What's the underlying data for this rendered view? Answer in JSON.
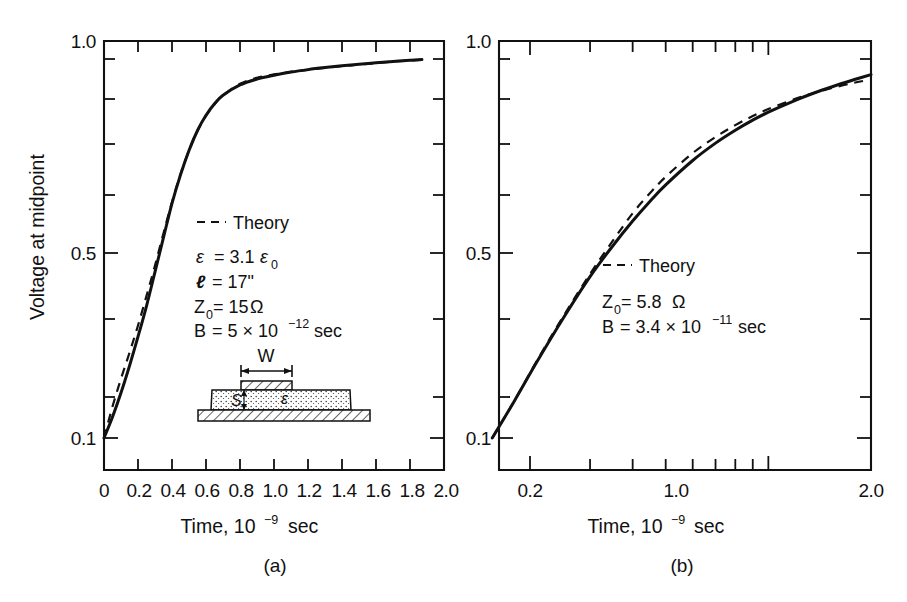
{
  "figure": {
    "caption_a": "(a)",
    "caption_b": "(b)",
    "y_axis_title": "Voltage at midpoint",
    "x_axis_title_prefix": "Time, 10",
    "x_axis_title_exp": "−9",
    "x_axis_title_suffix": "sec"
  },
  "chart_data": [
    {
      "type": "line",
      "panel": "(a)",
      "title": "",
      "xlabel": "Time, 10^-9 sec",
      "ylabel": "Voltage at midpoint",
      "xscale": "linear",
      "yscale": "log",
      "xlim": [
        0,
        2.0
      ],
      "ylim": [
        0.1,
        1.0
      ],
      "grid": false,
      "xticks": [
        0,
        0.2,
        0.4,
        0.6,
        0.8,
        1.0,
        1.2,
        1.4,
        1.6,
        1.8,
        2.0
      ],
      "xticklabels": [
        "0",
        "0.2",
        "0.4",
        "0.6",
        "0.8",
        "1.0",
        "1.2",
        "1.4",
        "1.6",
        "1.8",
        "2.0"
      ],
      "yticks": [
        0.1,
        0.2,
        0.3,
        0.4,
        0.5,
        0.6,
        0.7,
        0.8,
        0.9,
        1.0
      ],
      "yticklabels": [
        "0.1",
        "",
        "",
        "",
        "0.5",
        "",
        "",
        "",
        "",
        "1.0"
      ],
      "legend_position": "center",
      "series": [
        {
          "name": "Measured",
          "style": "solid",
          "x": [
            0.0,
            0.05,
            0.1,
            0.15,
            0.2,
            0.25,
            0.3,
            0.35,
            0.4,
            0.45,
            0.5,
            0.55,
            0.6,
            0.65,
            0.7,
            0.8,
            0.9,
            1.0,
            1.1,
            1.2,
            1.3,
            1.4,
            1.5,
            1.6,
            1.7,
            1.8,
            1.87
          ],
          "y": [
            0.1,
            0.113,
            0.13,
            0.152,
            0.18,
            0.215,
            0.262,
            0.32,
            0.39,
            0.46,
            0.53,
            0.595,
            0.65,
            0.695,
            0.73,
            0.775,
            0.802,
            0.82,
            0.835,
            0.847,
            0.857,
            0.866,
            0.874,
            0.881,
            0.888,
            0.894,
            0.898
          ]
        },
        {
          "name": "Theory",
          "style": "dashed",
          "x": [
            0.0,
            0.05,
            0.1,
            0.15,
            0.2,
            0.25,
            0.3,
            0.35,
            0.4,
            0.45,
            0.5,
            0.55,
            0.6,
            0.65,
            0.7,
            0.8,
            0.9,
            1.0,
            1.1,
            1.2,
            1.3,
            1.4,
            1.5,
            1.6,
            1.7,
            1.8,
            1.87
          ],
          "y": [
            0.1,
            0.12,
            0.141,
            0.164,
            0.192,
            0.228,
            0.272,
            0.328,
            0.393,
            0.462,
            0.53,
            0.594,
            0.648,
            0.693,
            0.729,
            0.78,
            0.808,
            0.824,
            0.836,
            0.846,
            0.855,
            0.864,
            0.872,
            0.88,
            0.887,
            0.893,
            0.897
          ]
        }
      ],
      "annotations": {
        "legend_label": "Theory",
        "lines": [
          {
            "sym": "ε",
            "eq": "= 3.1",
            "unit": "ε",
            "unit_sub": "0"
          },
          {
            "sym": "ℓ",
            "eq": "= 17\""
          },
          {
            "sym": "Z",
            "sym_sub": "0",
            "eq": "= 15",
            "unit": "Ω"
          },
          {
            "sym": "B",
            "eq": "= 5 × 10",
            "exp": "−12",
            "unit": "sec"
          }
        ]
      },
      "inset": {
        "width_label": "W",
        "substrate_label": "S",
        "permittivity_label": "ε"
      }
    },
    {
      "type": "line",
      "panel": "(b)",
      "title": "",
      "xlabel": "Time, 10^-9 sec",
      "ylabel": "Voltage at midpoint",
      "xscale": "log",
      "yscale": "log",
      "xlim": [
        0.15,
        2.0
      ],
      "ylim": [
        0.1,
        1.0
      ],
      "grid": false,
      "xticks": [
        0.2,
        0.3,
        0.4,
        0.5,
        0.6,
        0.7,
        0.8,
        0.9,
        1.0,
        2.0
      ],
      "xticklabels": [
        "0.2",
        "",
        "",
        "",
        "",
        "",
        "",
        "",
        "1.0",
        "2.0"
      ],
      "yticks": [
        0.1,
        0.2,
        0.3,
        0.4,
        0.5,
        0.6,
        0.7,
        0.8,
        0.9,
        1.0
      ],
      "yticklabels": [
        "0.1",
        "",
        "",
        "",
        "0.5",
        "",
        "",
        "",
        "",
        "1.0"
      ],
      "legend_position": "center",
      "series": [
        {
          "name": "Measured",
          "style": "solid",
          "x": [
            0.155,
            0.18,
            0.21,
            0.25,
            0.3,
            0.35,
            0.4,
            0.45,
            0.5,
            0.6,
            0.7,
            0.8,
            0.9,
            1.0,
            1.2,
            1.4,
            1.6,
            1.8,
            2.0
          ],
          "y": [
            0.1,
            0.124,
            0.156,
            0.2,
            0.255,
            0.305,
            0.352,
            0.395,
            0.434,
            0.5,
            0.553,
            0.596,
            0.632,
            0.662,
            0.709,
            0.746,
            0.776,
            0.801,
            0.823
          ]
        },
        {
          "name": "Theory",
          "style": "dashed",
          "x": [
            0.155,
            0.18,
            0.21,
            0.25,
            0.3,
            0.35,
            0.4,
            0.45,
            0.5,
            0.6,
            0.7,
            0.8,
            0.9,
            1.0,
            1.2,
            1.4,
            1.6,
            1.8,
            2.0
          ],
          "y": [
            0.1,
            0.124,
            0.157,
            0.202,
            0.259,
            0.314,
            0.368,
            0.414,
            0.455,
            0.522,
            0.573,
            0.614,
            0.647,
            0.674,
            0.715,
            0.745,
            0.768,
            0.786,
            0.8
          ]
        }
      ],
      "annotations": {
        "legend_label": "Theory",
        "lines": [
          {
            "sym": "Z",
            "sym_sub": "0",
            "eq": "= 5.8",
            "unit": "Ω"
          },
          {
            "sym": "B",
            "eq": "= 3.4 × 10",
            "exp": "−11",
            "unit": "sec"
          }
        ]
      }
    }
  ]
}
